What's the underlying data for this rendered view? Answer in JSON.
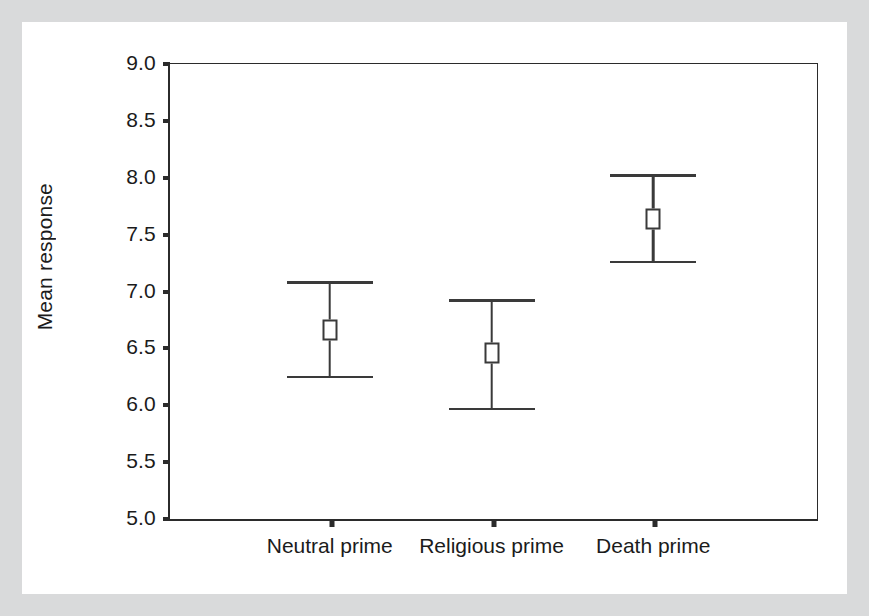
{
  "chart_data": {
    "type": "scatter",
    "title": "",
    "xlabel": "",
    "ylabel": "Mean response",
    "ylim": [
      5.0,
      9.0
    ],
    "ytick_step": 0.5,
    "yticks": [
      "9.0",
      "8.5",
      "8.0",
      "7.5",
      "7.0",
      "6.5",
      "6.0",
      "5.5",
      "5.0"
    ],
    "ytick_values": [
      9.0,
      8.5,
      8.0,
      7.5,
      7.0,
      6.5,
      6.0,
      5.5,
      5.0
    ],
    "grid": false,
    "legend": "none",
    "error_style": "confidence-interval-with-caps",
    "marker": "open-square",
    "categories": [
      "Neutral prime",
      "Religious prime",
      "Death prime"
    ],
    "values": [
      6.65,
      6.45,
      7.63
    ],
    "error_low": [
      6.24,
      5.96,
      7.25
    ],
    "error_high": [
      7.07,
      6.91,
      8.01
    ],
    "points": [
      {
        "category": "Neutral prime",
        "mean": 6.65,
        "ci_low": 6.24,
        "ci_high": 7.07
      },
      {
        "category": "Religious prime",
        "mean": 6.45,
        "ci_low": 5.96,
        "ci_high": 6.91
      },
      {
        "category": "Death prime",
        "mean": 7.63,
        "ci_low": 7.25,
        "ci_high": 8.01
      }
    ]
  },
  "colors": {
    "page_background": "#ffffff",
    "scan_margin": "#d9dadb",
    "axis": "#2b2b2b",
    "data": "#3a3a3a",
    "text": "#1b1b1b"
  }
}
